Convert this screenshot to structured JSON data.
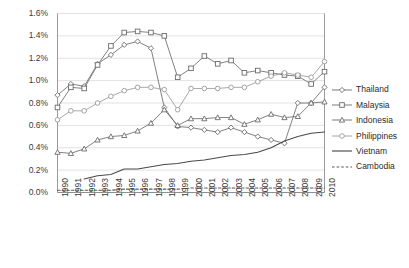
{
  "chart_data": {
    "type": "line",
    "title": "",
    "xlabel": "",
    "ylabel": "",
    "grid": true,
    "legend_position": "right",
    "ylim": [
      0,
      1.6
    ],
    "yticks": [
      "0.0%",
      "0.2%",
      "0.4%",
      "0.6%",
      "0.8%",
      "1.0%",
      "1.2%",
      "1.4%",
      "1.6%"
    ],
    "ytick_values": [
      0.0,
      0.2,
      0.4,
      0.6,
      0.8,
      1.0,
      1.2,
      1.4,
      1.6
    ],
    "categories": [
      "1990",
      "1991",
      "1992",
      "1993",
      "1994",
      "1995",
      "1996",
      "1997",
      "1998",
      "1999",
      "2000",
      "2001",
      "2002",
      "2003",
      "2004",
      "2005",
      "2006",
      "2007",
      "2008",
      "2009",
      "2010"
    ],
    "x": [
      1990,
      1991,
      1992,
      1993,
      1994,
      1995,
      1996,
      1997,
      1998,
      1999,
      2000,
      2001,
      2002,
      2003,
      2004,
      2005,
      2006,
      2007,
      2008,
      2009,
      2010
    ],
    "series": [
      {
        "name": "Thailand",
        "marker": "diamond",
        "style": "solid",
        "color": "#6b6b6b",
        "values": [
          0.87,
          0.97,
          0.95,
          1.15,
          1.23,
          1.32,
          1.35,
          1.29,
          0.76,
          0.59,
          0.58,
          0.56,
          0.54,
          0.58,
          0.54,
          0.5,
          0.47,
          0.44,
          0.8,
          0.8,
          0.94
        ]
      },
      {
        "name": "Malaysia",
        "marker": "square",
        "style": "solid",
        "color": "#6b6b6b",
        "values": [
          0.76,
          0.94,
          0.93,
          1.14,
          1.31,
          1.43,
          1.44,
          1.43,
          1.4,
          1.03,
          1.11,
          1.22,
          1.15,
          1.18,
          1.07,
          1.09,
          1.07,
          1.05,
          1.04,
          0.97,
          1.08
        ]
      },
      {
        "name": "Indonesia",
        "marker": "triangle",
        "style": "solid",
        "color": "#6b6b6b",
        "values": [
          0.36,
          0.35,
          0.39,
          0.47,
          0.5,
          0.51,
          0.55,
          0.62,
          0.74,
          0.6,
          0.66,
          0.66,
          0.67,
          0.67,
          0.61,
          0.65,
          0.7,
          0.67,
          0.68,
          0.8,
          0.81
        ]
      },
      {
        "name": "Philippines",
        "marker": "circle",
        "style": "solid",
        "color": "#9a9a9a",
        "values": [
          0.65,
          0.73,
          0.73,
          0.8,
          0.86,
          0.91,
          0.94,
          0.94,
          0.92,
          0.74,
          0.93,
          0.93,
          0.93,
          0.94,
          0.94,
          0.99,
          1.04,
          1.07,
          1.05,
          1.03,
          1.17
        ]
      },
      {
        "name": "Vietnam",
        "marker": "none",
        "style": "solid",
        "color": "#4a4a4a",
        "values": [
          null,
          null,
          0.12,
          0.15,
          0.16,
          0.21,
          0.21,
          0.23,
          0.25,
          0.26,
          0.28,
          0.29,
          0.31,
          0.33,
          0.34,
          0.36,
          0.4,
          0.46,
          0.5,
          0.53,
          0.54
        ]
      },
      {
        "name": "Cambodia",
        "marker": "none",
        "style": "dashed",
        "color": "#5a5a5a",
        "values": [
          0.02,
          0.02,
          0.02,
          0.02,
          0.02,
          0.03,
          0.03,
          0.03,
          0.03,
          0.03,
          0.04,
          0.04,
          0.04,
          0.04,
          0.04,
          0.04,
          0.04,
          0.04,
          0.04,
          0.04,
          0.04
        ]
      }
    ]
  },
  "legend": {
    "items": [
      {
        "label": "Thailand"
      },
      {
        "label": "Malaysia"
      },
      {
        "label": "Indonesia"
      },
      {
        "label": "Philippines"
      },
      {
        "label": "Vietnam"
      },
      {
        "label": "Cambodia"
      }
    ]
  },
  "axes": {
    "y_tick_labels": [
      "1.6%",
      "1.4%",
      "1.2%",
      "1.0%",
      "0.8%",
      "0.6%",
      "0.4%",
      "0.2%",
      "0.0%"
    ],
    "x_tick_labels": [
      "1990",
      "1991",
      "1992",
      "1993",
      "1994",
      "1995",
      "1996",
      "1997",
      "1998",
      "1999",
      "2000",
      "2001",
      "2002",
      "2003",
      "2004",
      "2005",
      "2006",
      "2007",
      "2008",
      "2009",
      "2010"
    ]
  },
  "colors": {
    "grid": "#e2e2e2",
    "axis": "#9a9a9a",
    "text": "#2b2b2b",
    "background": "#ffffff"
  }
}
